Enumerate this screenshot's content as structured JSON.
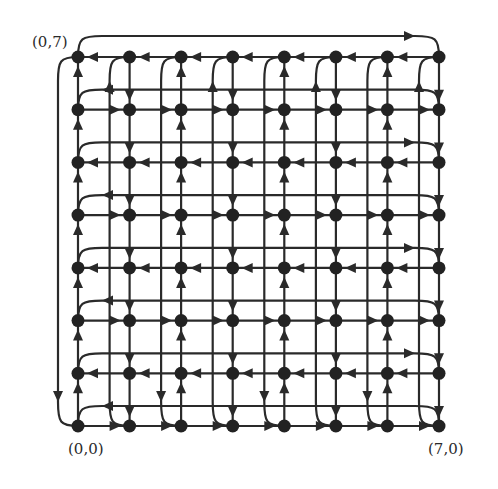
{
  "diagram": {
    "type": "directed-grid-graph",
    "size": 8,
    "labels": {
      "top_left": "(0,7)",
      "bottom_left": "(0,0)",
      "bottom_right": "(7,0)"
    },
    "colors": {
      "stroke": "#2a2a2a",
      "node": "#222222",
      "background": "#ffffff"
    },
    "layout": {
      "col_x": [
        78,
        129.6,
        181.1,
        232.7,
        284.3,
        335.9,
        387.4,
        439
      ],
      "row_y": {
        "0": 426,
        "1": 373.3,
        "2": 320.6,
        "3": 267.9,
        "4": 215.1,
        "5": 162.4,
        "6": 109.7,
        "7": 57
      },
      "bus_offset": 20,
      "top_bus_y": 36,
      "left_bus_x": 58
    },
    "row_edge_direction": {
      "7": "left",
      "6": "right",
      "5": "left",
      "4": "right",
      "3": "left",
      "2": "right",
      "1": "left",
      "0": "right"
    },
    "col_edge_direction": {
      "0": "up",
      "1": "down",
      "2": "up",
      "3": "down",
      "4": "up",
      "5": "down",
      "6": "up",
      "7": "down"
    },
    "horizontal_buses": [
      {
        "above_row": 7,
        "arrow": "right"
      },
      {
        "above_row": 6,
        "arrow": "left"
      },
      {
        "above_row": 5,
        "arrow": "right"
      },
      {
        "above_row": 4,
        "arrow": "left"
      },
      {
        "above_row": 3,
        "arrow": "right"
      },
      {
        "above_row": 2,
        "arrow": "left"
      },
      {
        "above_row": 1,
        "arrow": "right"
      },
      {
        "above_row": 0,
        "arrow": "left"
      }
    ],
    "vertical_buses": [
      {
        "left_of_col": 0,
        "arrow": "down"
      },
      {
        "left_of_col": 1,
        "arrow": "up"
      },
      {
        "left_of_col": 2,
        "arrow": "down"
      },
      {
        "left_of_col": 3,
        "arrow": "up"
      },
      {
        "left_of_col": 4,
        "arrow": "down"
      },
      {
        "left_of_col": 5,
        "arrow": "up"
      },
      {
        "left_of_col": 6,
        "arrow": "down"
      },
      {
        "left_of_col": 7,
        "arrow": "up"
      }
    ]
  }
}
